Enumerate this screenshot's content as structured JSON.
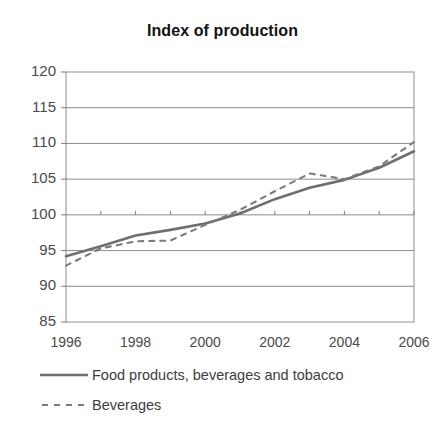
{
  "chart_data": {
    "type": "line",
    "title": "Index of production",
    "xlabel": "",
    "ylabel": "",
    "ylim": [
      85,
      120
    ],
    "yticks": [
      85,
      90,
      95,
      100,
      105,
      110,
      115,
      120
    ],
    "xlim": [
      1996,
      2006
    ],
    "xticks": [
      1996,
      1998,
      2000,
      2002,
      2004,
      2006
    ],
    "xticks_minor": [
      1996,
      1997,
      1998,
      1999,
      2000,
      2001,
      2002,
      2003,
      2004,
      2005,
      2006
    ],
    "grid": true,
    "legend_position": "bottom-left",
    "x": [
      1996,
      1997,
      1998,
      1999,
      2000,
      2001,
      2002,
      2003,
      2004,
      2005,
      2006
    ],
    "series": [
      {
        "name": "Food products, beverages and tobacco",
        "style": "solid",
        "color": "#6e6e6e",
        "values": [
          94.2,
          95.6,
          97.1,
          97.9,
          98.8,
          100.2,
          102.2,
          103.8,
          104.9,
          106.6,
          108.9
        ]
      },
      {
        "name": "Beverages",
        "style": "dashed",
        "color": "#7a7a7a",
        "values": [
          92.9,
          95.3,
          96.3,
          96.4,
          98.6,
          100.7,
          103.3,
          105.8,
          105.0,
          106.8,
          110.2
        ]
      }
    ]
  },
  "axis": {
    "ytick_labels": [
      "120",
      "115",
      "110",
      "105",
      "100",
      "95",
      "90",
      "85"
    ],
    "xtick_labels": [
      "1996",
      "1998",
      "2000",
      "2002",
      "2004",
      "2006"
    ]
  },
  "legend": {
    "items": [
      {
        "label": "Food products, beverages and tobacco",
        "key": "solid-line-key"
      },
      {
        "label": "Beverages",
        "key": "dashed-line-key"
      }
    ]
  },
  "colors": {
    "axis": "#7d7d7d",
    "grid": "#8c8c8c",
    "series_solid": "#6e6e6e",
    "series_dashed": "#7a7a7a",
    "title": "#121212",
    "tick_text": "#4a4a4a"
  }
}
